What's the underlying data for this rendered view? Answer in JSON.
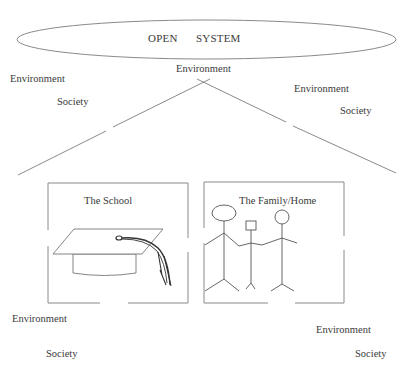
{
  "diagram": {
    "ellipse": {
      "word1": "OPEN",
      "word2": "SYSTEM"
    },
    "apex_label": "Environment",
    "upper_left": {
      "environment": "Environment",
      "society": "Society"
    },
    "upper_right": {
      "environment": "Environment",
      "society": "Society"
    },
    "boxes": [
      {
        "title": "The School",
        "illustration": "graduation-cap"
      },
      {
        "title": "The Family/Home",
        "illustration": "stick-figure-family"
      }
    ],
    "lower_left": {
      "environment": "Environment",
      "society": "Society"
    },
    "lower_right": {
      "environment": "Environment",
      "society": "Society"
    },
    "colors": {
      "line": "#8a8a8a",
      "text": "#3a3a3a",
      "background": "#ffffff"
    }
  }
}
